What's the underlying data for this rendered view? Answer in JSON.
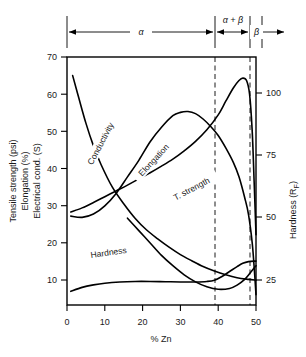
{
  "chart_data": {
    "type": "line",
    "title": "",
    "xlabel": "% Zn",
    "ylabel_left": "Tensile strength (psi)\nElongation (%)\nElectrical cond. (S)",
    "ylabel_left_lines": [
      "Tensile strength (psi)",
      "Elongation (%)",
      "Electrical cond. (S)"
    ],
    "ylabel_right": "Hardness (R",
    "ylabel_right_sub": "F",
    "ylabel_right_tail": ")",
    "xlim": [
      0,
      50
    ],
    "ylim_left": [
      10,
      70
    ],
    "ylim_right": [
      12.5,
      112.5
    ],
    "xticks": [
      0,
      10,
      20,
      30,
      40,
      50
    ],
    "xtick_labels": [
      "0",
      "10",
      "20",
      "30",
      "40",
      "50"
    ],
    "yticks_left": [
      10,
      20,
      30,
      40,
      50,
      60,
      70
    ],
    "ytick_labels_left": [
      "10",
      "20",
      "30",
      "40",
      "50",
      "60",
      "70"
    ],
    "yticks_right": [
      25,
      50,
      75,
      100
    ],
    "ytick_labels_right": [
      "25",
      "50",
      "75",
      "100"
    ],
    "grid": false,
    "legend": "inline-curve-labels",
    "phase_boundaries": [
      39,
      48
    ],
    "phase_regions": [
      {
        "label": "α",
        "x_start": 0,
        "x_end": 39
      },
      {
        "label": "α + β",
        "x_start": 39,
        "x_end": 48
      },
      {
        "label": "β",
        "x_start": 48,
        "x_end": 50
      }
    ],
    "series": [
      {
        "name": "Conductivity",
        "label": "Conductivity",
        "axis": "left",
        "points": [
          [
            1.5,
            65.5
          ],
          [
            3,
            60.5
          ],
          [
            5,
            54
          ],
          [
            7,
            48.5
          ],
          [
            9,
            44
          ],
          [
            12,
            38.5
          ],
          [
            15,
            34.5
          ],
          [
            18,
            31
          ],
          [
            21,
            28.2
          ],
          [
            24,
            26
          ],
          [
            27,
            24
          ],
          [
            30,
            22.2
          ],
          [
            33,
            20.7
          ],
          [
            36,
            19.3
          ],
          [
            39,
            18.2
          ],
          [
            42,
            17.3
          ],
          [
            45,
            16.6
          ],
          [
            48,
            16.2
          ],
          [
            50,
            16
          ]
        ]
      },
      {
        "name": "Elongation",
        "label": "Elongation",
        "axis": "left",
        "points": [
          [
            1,
            31.5
          ],
          [
            4,
            31.2
          ],
          [
            7,
            32
          ],
          [
            10,
            34
          ],
          [
            13,
            37
          ],
          [
            16,
            41
          ],
          [
            19,
            45
          ],
          [
            22,
            49.5
          ],
          [
            25,
            53
          ],
          [
            28,
            55.8
          ],
          [
            30,
            56.6
          ],
          [
            32,
            56.8
          ],
          [
            34,
            56.3
          ],
          [
            36,
            55
          ],
          [
            38,
            53.2
          ],
          [
            40,
            51
          ],
          [
            42,
            48
          ],
          [
            44,
            44.5
          ],
          [
            45.5,
            41
          ],
          [
            47,
            36
          ],
          [
            48,
            32
          ],
          [
            49,
            25
          ],
          [
            49.6,
            18
          ],
          [
            50,
            12.5
          ]
        ]
      },
      {
        "name": "T. strength",
        "label": "T. strength",
        "axis": "left",
        "points": [
          [
            1,
            32.5
          ],
          [
            4,
            33.5
          ],
          [
            7,
            34.8
          ],
          [
            10,
            36.2
          ],
          [
            13,
            37.6
          ],
          [
            16,
            39
          ],
          [
            19,
            40.5
          ],
          [
            22,
            42
          ],
          [
            25,
            43.6
          ],
          [
            28,
            45.3
          ],
          [
            31,
            47.3
          ],
          [
            34,
            49.6
          ],
          [
            37,
            52.4
          ],
          [
            40,
            56
          ],
          [
            42,
            59.3
          ],
          [
            44,
            62.5
          ],
          [
            45.5,
            64.3
          ],
          [
            46.5,
            64.9
          ],
          [
            47.5,
            64.3
          ],
          [
            48.3,
            61
          ],
          [
            49,
            52
          ],
          [
            49.5,
            40
          ],
          [
            50,
            27
          ]
        ]
      },
      {
        "name": "Hardness",
        "label": "Hardness",
        "axis": "right",
        "points": [
          [
            1,
            18
          ],
          [
            4,
            19.6
          ],
          [
            7,
            20.6
          ],
          [
            10,
            21.3
          ],
          [
            14,
            21.8
          ],
          [
            18,
            22
          ],
          [
            22,
            22
          ],
          [
            26,
            21.9
          ],
          [
            30,
            21.8
          ],
          [
            34,
            21.8
          ],
          [
            37,
            22
          ],
          [
            39,
            22.5
          ],
          [
            41,
            24
          ],
          [
            43,
            26
          ],
          [
            45,
            28
          ],
          [
            46.5,
            29.3
          ],
          [
            48,
            30
          ],
          [
            50,
            30.2
          ]
        ]
      },
      {
        "name": "Conductivity-rise",
        "label": "",
        "axis": "left",
        "points": [
          [
            16,
            31
          ],
          [
            19,
            28
          ],
          [
            22,
            25
          ],
          [
            25,
            22
          ],
          [
            28,
            19.5
          ],
          [
            31,
            17.3
          ],
          [
            34,
            15.6
          ],
          [
            37,
            14.4
          ],
          [
            40,
            13.8
          ],
          [
            43,
            14
          ],
          [
            45,
            14.8
          ],
          [
            47,
            16.2
          ],
          [
            48.5,
            17.8
          ],
          [
            50,
            19.5
          ]
        ]
      }
    ],
    "annotations": [
      {
        "text": "Conductivity",
        "x": 9,
        "y": 49,
        "rotation": -62
      },
      {
        "text": "Elongation",
        "x": 23,
        "y": 45,
        "rotation": -47
      },
      {
        "text": "T. strength",
        "x": 33,
        "y": 38,
        "rotation": -28
      },
      {
        "text": "Hardness",
        "x": 11,
        "y": 22.6,
        "rotation": -8
      }
    ]
  }
}
